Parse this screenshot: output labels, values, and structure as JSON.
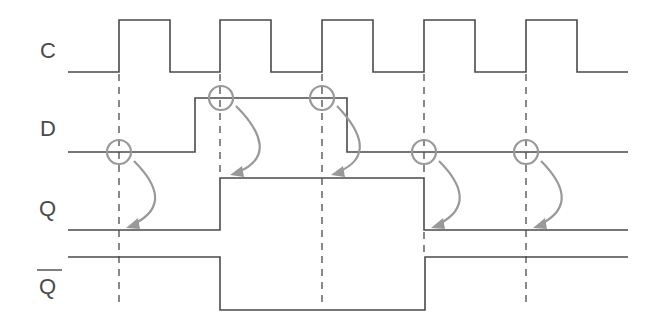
{
  "diagram": {
    "colors": {
      "signal": "#4a4a4a",
      "annotation": "#999999",
      "background": "#ffffff"
    },
    "signals": [
      {
        "id": "C",
        "label": "C",
        "overline": false
      },
      {
        "id": "D",
        "label": "D",
        "overline": false
      },
      {
        "id": "Q",
        "label": "Q",
        "overline": false
      },
      {
        "id": "Qbar",
        "label": "Q",
        "overline": true
      }
    ],
    "clock_rising_edges_x": [
      119,
      220,
      322,
      424,
      526
    ],
    "waveforms": {
      "C": "1-0,2-1,3-0,4-1,5-0 (5 pulses)",
      "D": "low, high before edge 2, low after edge 3",
      "Q": "low, high from edge 2 to edge 4, low",
      "Qbar": "inverse of Q"
    },
    "sample_markers": [
      {
        "edge": 1,
        "d_value": "0",
        "q_result": "0"
      },
      {
        "edge": 2,
        "d_value": "1",
        "q_result": "1"
      },
      {
        "edge": 3,
        "d_value": "1",
        "q_result": "1"
      },
      {
        "edge": 4,
        "d_value": "0",
        "q_result": "0"
      },
      {
        "edge": 5,
        "d_value": "0",
        "q_result": "0"
      }
    ]
  }
}
